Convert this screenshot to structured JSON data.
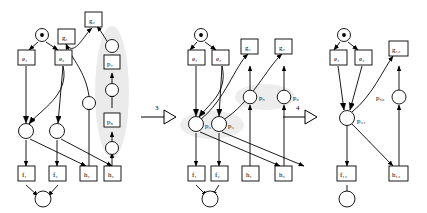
{
  "figure": {
    "type": "petri-net-transformation",
    "title": "",
    "panels": [
      {
        "id": "panel-1",
        "name": "original-net",
        "source_place": {
          "name": "p0",
          "label": "",
          "tokens": 1
        },
        "transitions": [
          {
            "name": "e1",
            "label": "e₁"
          },
          {
            "name": "e2",
            "label": "e₂"
          },
          {
            "name": "g1",
            "label": "g₁"
          },
          {
            "name": "g2",
            "label": "g₂"
          },
          {
            "name": "f1",
            "label": "f₁"
          },
          {
            "name": "f2",
            "label": "f₂"
          },
          {
            "name": "h1",
            "label": "h₁"
          },
          {
            "name": "h2",
            "label": "h₂"
          },
          {
            "name": "p7",
            "label": "p₇"
          },
          {
            "name": "p8",
            "label": "p₈"
          }
        ],
        "places_unlabeled": 7,
        "highlight": {
          "shape": "ellipse",
          "name": "highlight-chain",
          "color": "#e8e8e8"
        }
      },
      {
        "id": "panel-2",
        "name": "reduced-net-step3",
        "source_place": {
          "name": "p0",
          "label": "",
          "tokens": 1
        },
        "transitions": [
          {
            "name": "e1",
            "label": "e₁"
          },
          {
            "name": "e2",
            "label": "e₂"
          },
          {
            "name": "g1",
            "label": "g₁"
          },
          {
            "name": "g2",
            "label": "g₂"
          },
          {
            "name": "f1",
            "label": "f₁"
          },
          {
            "name": "f2",
            "label": "f₂"
          },
          {
            "name": "h1",
            "label": "h₁"
          },
          {
            "name": "h2",
            "label": "h₂"
          }
        ],
        "places": [
          {
            "name": "p3",
            "label": "p₃"
          },
          {
            "name": "p4",
            "label": "p₄"
          },
          {
            "name": "p5",
            "label": "p₅"
          },
          {
            "name": "p6",
            "label": "p₆"
          }
        ],
        "highlight": {
          "shape": "ellipse",
          "name": "highlight-places",
          "color": "#ececec"
        }
      },
      {
        "id": "panel-3",
        "name": "reduced-net-step4",
        "source_place": {
          "name": "p0",
          "label": "",
          "tokens": 1
        },
        "transitions": [
          {
            "name": "e1",
            "label": "e₁"
          },
          {
            "name": "e2",
            "label": "e₂"
          },
          {
            "name": "g12",
            "label": "g₁₂"
          },
          {
            "name": "f12",
            "label": "f₁₂"
          },
          {
            "name": "h12",
            "label": "h₁₂"
          }
        ],
        "places": [
          {
            "name": "p34",
            "label": "p₃₄"
          },
          {
            "name": "p56",
            "label": "p₅₆"
          }
        ]
      }
    ],
    "arrows": [
      {
        "name": "transform-arrow-3",
        "label": "3"
      },
      {
        "name": "transform-arrow-4",
        "label": "4"
      }
    ],
    "colors": {
      "stroke": "#000000",
      "background": "#ffffff",
      "highlight": "#e9e9e9",
      "node_fill": "#ffffff"
    }
  }
}
